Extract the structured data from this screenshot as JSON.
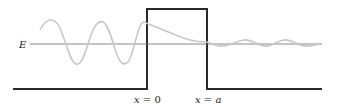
{
  "diagram": {
    "energy_label": "E",
    "boundary_labels": [
      {
        "var": "x",
        "eq": " = ",
        "val": "0"
      },
      {
        "var": "x",
        "eq": " = ",
        "val": "a"
      }
    ],
    "colors": {
      "potential": "#2a2a2a",
      "energy_line": "#6a6a6a",
      "wavefunction": "#c8c8c8"
    },
    "regions": [
      {
        "name": "incident",
        "description": "oscillating wave, large amplitude"
      },
      {
        "name": "barrier",
        "description": "exponentially decaying wave"
      },
      {
        "name": "transmitted",
        "description": "oscillating wave, small amplitude"
      }
    ]
  }
}
